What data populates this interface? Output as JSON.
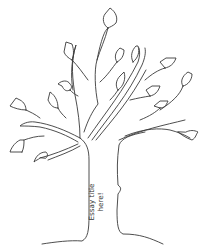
{
  "illustration": {
    "subject": "bare tree line drawing with leaves",
    "line_color": "#3a3a3a",
    "background": "#ffffff"
  },
  "trunk_label": {
    "line1": "Essay title",
    "line2": "here!"
  }
}
